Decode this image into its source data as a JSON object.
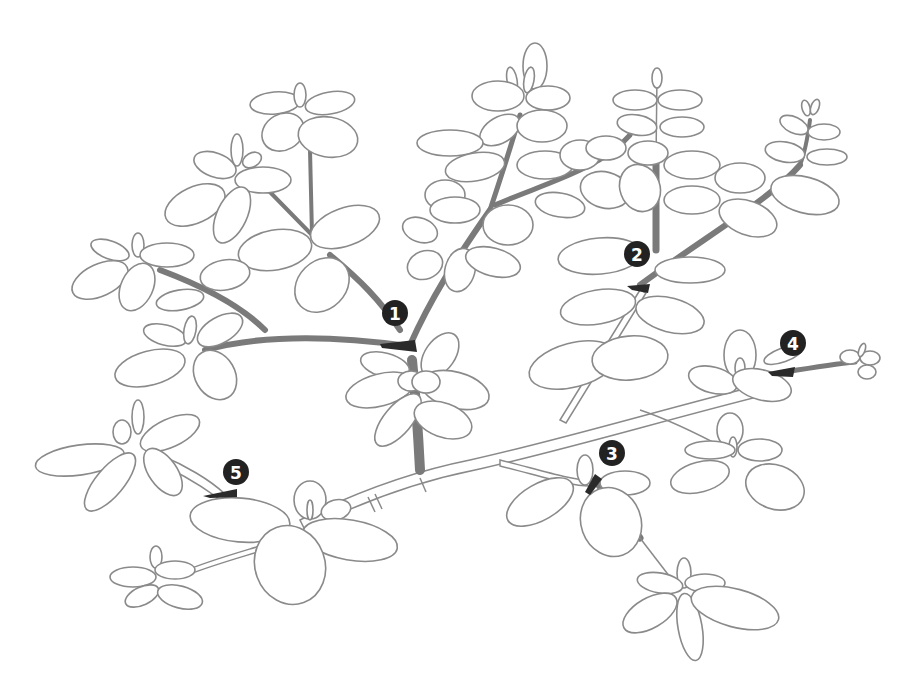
{
  "diagram": {
    "title_cropped": "",
    "line_color": "#8a8a8a",
    "shade_color": "#7a7a7a",
    "marker_color": "#222222",
    "marker_text_color": "#ffffff",
    "background": "#ffffff",
    "markers": [
      {
        "id": 1,
        "label": "1",
        "x": 395,
        "y": 313,
        "cut_x": 408,
        "cut_y": 346
      },
      {
        "id": 2,
        "label": "2",
        "x": 637,
        "y": 254,
        "cut_x": 640,
        "cut_y": 289
      },
      {
        "id": 3,
        "label": "3",
        "x": 612,
        "y": 453,
        "cut_x": 595,
        "cut_y": 478
      },
      {
        "id": 4,
        "label": "4",
        "x": 793,
        "y": 343,
        "cut_x": 785,
        "cut_y": 372
      },
      {
        "id": 5,
        "label": "5",
        "x": 236,
        "y": 472,
        "cut_x": 225,
        "cut_y": 494
      }
    ]
  }
}
